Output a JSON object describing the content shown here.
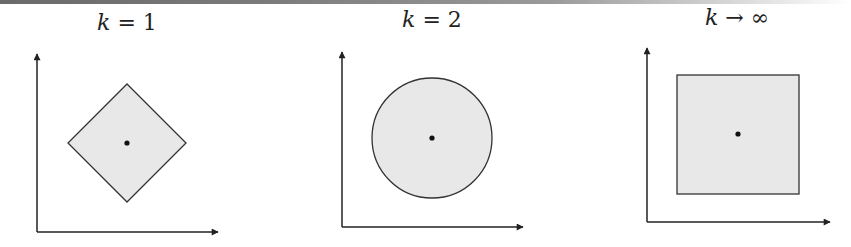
{
  "figure": {
    "colors": {
      "fill": "#e8e8e8",
      "stroke": "#333333",
      "axis": "#222222",
      "dot": "#111111"
    },
    "panels": [
      {
        "id": "k1",
        "label_var": "k",
        "label_rest": " = 1",
        "shape": "diamond",
        "center": [
          127,
          143
        ],
        "half_size": 59,
        "axis": {
          "origin": [
            37,
            232
          ],
          "y_tip": 54,
          "x_tip": 218
        },
        "label_pos": [
          127,
          30
        ]
      },
      {
        "id": "k2",
        "label_var": "k",
        "label_rest": " = 2",
        "shape": "circle",
        "center": [
          432,
          138
        ],
        "half_size": 60,
        "axis": {
          "origin": [
            342,
            227
          ],
          "y_tip": 52,
          "x_tip": 523
        },
        "label_pos": [
          432,
          27
        ]
      },
      {
        "id": "kinf",
        "label_var": "k",
        "label_rest": " → ∞",
        "shape": "square",
        "center": [
          738,
          134
        ],
        "half_size": 60,
        "axis": {
          "origin": [
            647,
            222
          ],
          "y_tip": 48,
          "x_tip": 830
        },
        "label_pos": [
          737,
          25
        ]
      }
    ]
  }
}
